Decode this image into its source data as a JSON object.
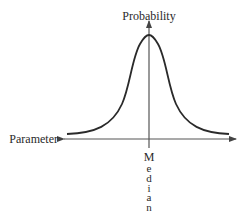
{
  "diagram": {
    "type": "bell-curve",
    "y_axis_label": "Probability",
    "x_axis_label": "Parameter",
    "center_label": "Median",
    "center_label_letters": [
      "M",
      "e",
      "d",
      "i",
      "a",
      "n"
    ],
    "colors": {
      "curve": "#2a2a2a",
      "axis": "#555555",
      "text": "#2a2a2a",
      "background": "#ffffff"
    }
  }
}
